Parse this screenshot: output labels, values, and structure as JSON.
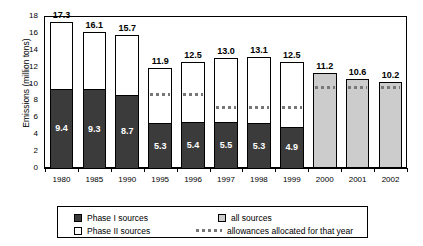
{
  "chart_data": {
    "type": "bar",
    "title": "",
    "xlabel": "",
    "ylabel": "Emissions (million tons)",
    "ylim": [
      0,
      18
    ],
    "yticks": [
      0,
      2,
      4,
      6,
      8,
      10,
      12,
      14,
      16,
      18
    ],
    "grid": false,
    "legend_position": "bottom",
    "categories": [
      "1980",
      "1985",
      "1990",
      "1995",
      "1996",
      "1997",
      "1998",
      "1999",
      "2000",
      "2001",
      "2002"
    ],
    "series": [
      {
        "name": "Phase I sources",
        "values": [
          9.4,
          9.3,
          8.7,
          5.3,
          5.4,
          5.5,
          5.3,
          4.9,
          null,
          null,
          null
        ]
      },
      {
        "name": "Phase II sources",
        "values": [
          7.9,
          6.8,
          7.0,
          6.6,
          7.1,
          7.5,
          7.8,
          7.6,
          null,
          null,
          null
        ]
      },
      {
        "name": "all sources",
        "values": [
          null,
          null,
          null,
          null,
          null,
          null,
          null,
          null,
          11.2,
          10.6,
          10.2
        ]
      },
      {
        "name": "allowances allocated for that year",
        "values": [
          null,
          null,
          null,
          8.7,
          8.6,
          7.1,
          7.1,
          7.1,
          9.5,
          9.5,
          9.5
        ]
      }
    ],
    "totals": [
      17.3,
      16.1,
      15.7,
      11.9,
      12.5,
      13.0,
      13.1,
      12.5,
      11.2,
      10.6,
      10.2
    ],
    "total_labels": [
      "17.3",
      "16.1",
      "15.7",
      "11.9",
      "12.5",
      "13.0",
      "13.1",
      "12.5",
      "11.2",
      "10.6",
      "10.2"
    ],
    "phase1_labels": [
      "9.4",
      "9.3",
      "8.7",
      "5.3",
      "5.4",
      "5.5",
      "5.3",
      "4.9",
      "",
      "",
      ""
    ],
    "colors": {
      "phase1": "#3b3b3b",
      "phase2": "#ffffff",
      "all_sources": "#cccccc",
      "allowances": "#777777",
      "axis": "#000000"
    }
  },
  "legend": {
    "items": [
      {
        "label": "Phase I sources",
        "swatch": "phase1-swatch"
      },
      {
        "label": "all sources",
        "swatch": "all-sources-swatch"
      },
      {
        "label": "Phase II sources",
        "swatch": "phase2-swatch"
      },
      {
        "label": "allowances allocated for that year",
        "swatch": "allowances-dotted-swatch"
      }
    ]
  }
}
